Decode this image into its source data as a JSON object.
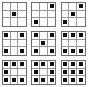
{
  "board": {
    "title": "Progressive matrix dot puzzle",
    "rows": 3,
    "columns": 3,
    "panel_grid_rows": 3,
    "panel_grid_columns": 3,
    "background_color": "#ffffff",
    "panel_border_color": "#6e6e6e",
    "cell_line_color": "#9a9a9a",
    "dot_color": "#111111",
    "dot_shape": "square"
  },
  "panels": [
    {
      "id": "panel-r1c1",
      "row": 1,
      "column": 1,
      "dot_count": 1,
      "pattern_name": "center",
      "cells": [
        0,
        0,
        0,
        0,
        1,
        0,
        0,
        0,
        0
      ]
    },
    {
      "id": "panel-r1c2",
      "row": 1,
      "column": 2,
      "dot_count": 2,
      "pattern_name": "anti-diagonal-ends",
      "cells": [
        0,
        0,
        1,
        0,
        0,
        0,
        1,
        0,
        0
      ]
    },
    {
      "id": "panel-r1c3",
      "row": 1,
      "column": 3,
      "dot_count": 3,
      "pattern_name": "anti-diagonal",
      "cells": [
        0,
        0,
        1,
        0,
        1,
        0,
        1,
        0,
        0
      ]
    },
    {
      "id": "panel-r2c1",
      "row": 2,
      "column": 1,
      "dot_count": 4,
      "pattern_name": "four-corners",
      "cells": [
        1,
        0,
        1,
        0,
        0,
        0,
        1,
        0,
        1
      ]
    },
    {
      "id": "panel-r2c2",
      "row": 2,
      "column": 2,
      "dot_count": 5,
      "pattern_name": "four-corners-plus-center",
      "cells": [
        1,
        0,
        1,
        0,
        1,
        0,
        1,
        0,
        1
      ]
    },
    {
      "id": "panel-r2c3",
      "row": 2,
      "column": 3,
      "dot_count": 6,
      "pattern_name": "top-and-bottom-rows",
      "cells": [
        1,
        1,
        1,
        0,
        0,
        0,
        1,
        1,
        1
      ]
    },
    {
      "id": "panel-r3c1",
      "row": 3,
      "column": 1,
      "dot_count": 7,
      "pattern_name": "all-but-center-and-middle-right",
      "cells": [
        1,
        1,
        1,
        1,
        0,
        0,
        1,
        1,
        1
      ]
    },
    {
      "id": "panel-r3c2",
      "row": 3,
      "column": 2,
      "dot_count": 8,
      "pattern_name": "all-but-center",
      "cells": [
        1,
        1,
        1,
        1,
        0,
        1,
        1,
        1,
        1
      ]
    },
    {
      "id": "panel-r3c3",
      "row": 3,
      "column": 3,
      "dot_count": 9,
      "pattern_name": "full",
      "cells": [
        1,
        1,
        1,
        1,
        1,
        1,
        1,
        1,
        1
      ]
    }
  ]
}
